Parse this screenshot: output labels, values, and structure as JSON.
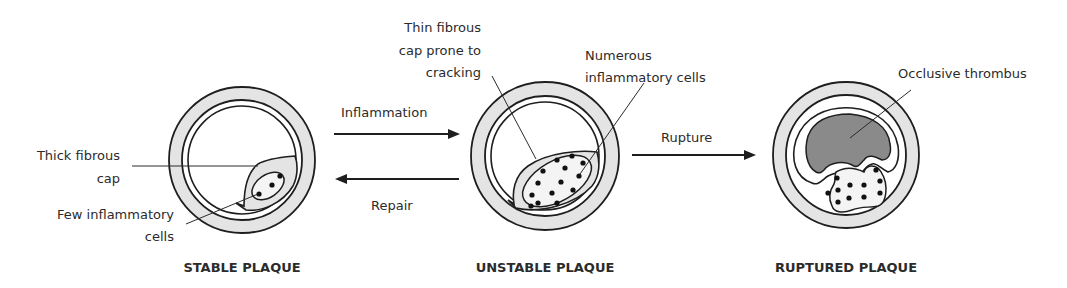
{
  "diagram": {
    "stages": [
      {
        "id": "stable",
        "title": "STABLE PLAQUE"
      },
      {
        "id": "unstable",
        "title": "UNSTABLE PLAQUE"
      },
      {
        "id": "ruptured",
        "title": "RUPTURED PLAQUE"
      }
    ],
    "transitions": {
      "inflammation": "Inflammation",
      "repair": "Repair",
      "rupture": "Rupture"
    },
    "annotations": {
      "stable": {
        "cap_line1": "Thick fibrous",
        "cap_line2": "cap",
        "cells_line1": "Few inflammatory",
        "cells_line2": "cells"
      },
      "unstable": {
        "cap_line1": "Thin fibrous",
        "cap_line2": "cap prone to",
        "cap_line3": "cracking",
        "cells_line1": "Numerous",
        "cells_line2": "inflammatory cells"
      },
      "ruptured": {
        "thrombus": "Occlusive thrombus"
      }
    },
    "colors": {
      "vessel_wall": "#e4e4e4",
      "thrombus": "#8a8a8a",
      "outline": "#1e1e1e",
      "cells": "#111111"
    }
  }
}
